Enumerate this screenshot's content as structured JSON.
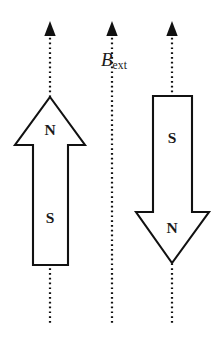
{
  "figure": {
    "background_color": "#ffffff",
    "line_color": "#111111",
    "text_color": "#1a1a1a",
    "width": 216,
    "height": 337
  },
  "field": {
    "label_symbol": "B",
    "label_subscript": "ext",
    "label_full": "B_ext",
    "label_x": 103,
    "label_y": 52,
    "count": 3,
    "direction": "up",
    "lines": [
      {
        "name": "field-line-left",
        "x": 50,
        "y_top": 22,
        "y_bottom": 323
      },
      {
        "name": "field-line-middle",
        "x": 112,
        "y_top": 22,
        "y_bottom": 323
      },
      {
        "name": "field-line-right",
        "x": 172,
        "y_top": 22,
        "y_bottom": 323
      }
    ]
  },
  "magnets": [
    {
      "id": "left-magnet",
      "orientation": "up",
      "aligned": true,
      "tip_x": 50,
      "tip_y": 97,
      "head_left": 15,
      "head_right": 85,
      "head_base_y": 145,
      "shaft_left": 33,
      "shaft_right": 68,
      "tail_y": 265,
      "poles": [
        {
          "name": "north-pole-label",
          "label": "N",
          "x": 50,
          "y": 131
        },
        {
          "name": "south-pole-label",
          "label": "S",
          "x": 50,
          "y": 219
        }
      ]
    },
    {
      "id": "right-magnet",
      "orientation": "down",
      "aligned": false,
      "tip_x": 172,
      "tip_y": 263,
      "head_left": 136,
      "head_right": 209,
      "head_base_y": 212,
      "shaft_left": 153,
      "shaft_right": 192,
      "tail_y": 96,
      "poles": [
        {
          "name": "south-pole-label",
          "label": "S",
          "x": 172,
          "y": 139
        },
        {
          "name": "north-pole-label",
          "label": "N",
          "x": 172,
          "y": 229
        }
      ]
    }
  ]
}
